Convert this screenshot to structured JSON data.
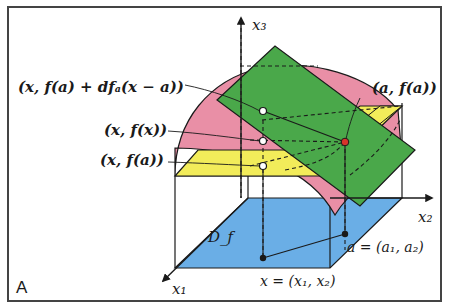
{
  "panel_label": "A",
  "colors": {
    "domain_fill": "#6aaee6",
    "graph_surface_fill": "#e98fa6",
    "tangent_plane_fill": "#4aa84a",
    "constant_plane_fill": "#f2ec5a",
    "point_a_fill": "#d9342b",
    "outline": "#1a1a1a"
  },
  "axes": {
    "x1": "x₁",
    "x2": "x₂",
    "x3": "x₃"
  },
  "labels": {
    "tangent_point": "(x, f(a) + dfₐ(x − a))",
    "graph_point": "(x, f(x))",
    "constant_point": "(x, f(a))",
    "base_point": "(a, f(a))",
    "domain": "D_f",
    "a_coords": "a = (a₁, a₂)",
    "x_coords": "x = (x₁, x₂)"
  }
}
